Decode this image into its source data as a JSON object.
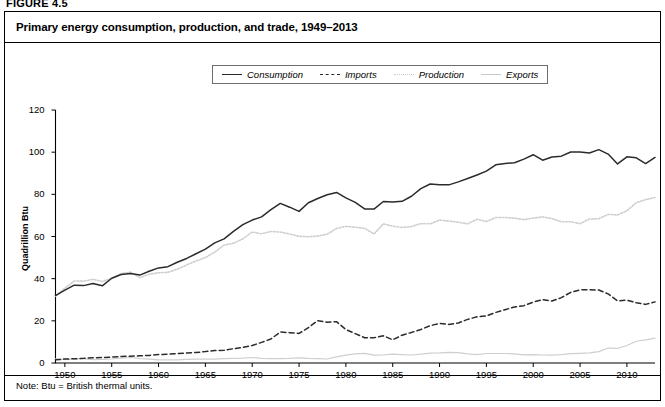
{
  "figure": {
    "number": "FIGURE 4.5",
    "title": "Primary energy consumption, production, and trade, 1949–2013",
    "note": "Note: Btu = British thermal units."
  },
  "legend": {
    "position": "top-center",
    "items": [
      {
        "label": "Consumption",
        "style": "solid",
        "color": "#2b2b2b",
        "icon": "line-solid-icon"
      },
      {
        "label": "Imports",
        "style": "dashed",
        "color": "#2b2b2b",
        "icon": "line-dashed-icon"
      },
      {
        "label": "Production",
        "style": "dotted",
        "color": "#c9c9c9",
        "icon": "line-dotted-icon"
      },
      {
        "label": "Exports",
        "style": "solid-light",
        "color": "#c9c9c9",
        "icon": "line-light-icon"
      }
    ]
  },
  "chart_data": {
    "type": "line",
    "title": "Primary energy consumption, production, and trade, 1949–2013",
    "xlabel": "",
    "ylabel": "Quadrillion Btu",
    "xlim": [
      1949,
      2013
    ],
    "ylim": [
      0,
      120
    ],
    "yticks": [
      0,
      20,
      40,
      60,
      80,
      100,
      120
    ],
    "xticks": [
      1950,
      1955,
      1960,
      1965,
      1970,
      1975,
      1980,
      1985,
      1990,
      1995,
      2000,
      2005,
      2010
    ],
    "grid": false,
    "legend_position": "top-center",
    "x": [
      1949,
      1950,
      1951,
      1952,
      1953,
      1954,
      1955,
      1956,
      1957,
      1958,
      1959,
      1960,
      1961,
      1962,
      1963,
      1964,
      1965,
      1966,
      1967,
      1968,
      1969,
      1970,
      1971,
      1972,
      1973,
      1974,
      1975,
      1976,
      1977,
      1978,
      1979,
      1980,
      1981,
      1982,
      1983,
      1984,
      1985,
      1986,
      1987,
      1988,
      1989,
      1990,
      1991,
      1992,
      1993,
      1994,
      1995,
      1996,
      1997,
      1998,
      1999,
      2000,
      2001,
      2002,
      2003,
      2004,
      2005,
      2006,
      2007,
      2008,
      2009,
      2010,
      2011,
      2012,
      2013
    ],
    "series": [
      {
        "name": "Consumption",
        "style": "solid",
        "color": "#2b2b2b",
        "values": [
          32.0,
          34.6,
          36.9,
          36.7,
          37.7,
          36.6,
          40.2,
          42.0,
          42.4,
          41.7,
          43.5,
          45.1,
          45.7,
          47.8,
          49.6,
          51.8,
          54.0,
          57.0,
          58.9,
          62.4,
          65.6,
          67.8,
          69.3,
          72.7,
          75.7,
          73.9,
          71.9,
          76.0,
          78.0,
          79.8,
          80.9,
          78.3,
          76.2,
          73.1,
          73.0,
          76.6,
          76.4,
          76.7,
          79.1,
          82.7,
          84.9,
          84.5,
          84.5,
          85.9,
          87.5,
          89.2,
          91.0,
          94.0,
          94.6,
          95.0,
          96.7,
          98.8,
          96.2,
          97.7,
          98.1,
          100.1,
          100.1,
          99.6,
          101.2,
          99.1,
          94.4,
          97.8,
          97.3,
          94.6,
          97.5
        ]
      },
      {
        "name": "Production",
        "style": "dotted",
        "color": "#c9c9c9",
        "values": [
          31.7,
          35.5,
          38.9,
          38.8,
          39.7,
          38.7,
          40.1,
          42.4,
          43.1,
          40.5,
          42.1,
          42.8,
          43.0,
          44.5,
          46.5,
          48.4,
          50.0,
          52.6,
          55.9,
          56.8,
          58.9,
          62.1,
          61.3,
          62.4,
          62.1,
          61.2,
          60.1,
          59.9,
          60.2,
          61.1,
          63.8,
          64.8,
          64.4,
          63.9,
          61.2,
          66.0,
          64.9,
          64.3,
          64.7,
          66.1,
          66.0,
          67.8,
          67.3,
          66.8,
          66.0,
          68.2,
          67.1,
          69.0,
          69.0,
          68.7,
          68.0,
          68.7,
          69.3,
          68.5,
          67.0,
          67.0,
          66.1,
          68.3,
          68.4,
          70.5,
          70.2,
          72.2,
          76.0,
          77.5,
          78.5
        ]
      },
      {
        "name": "Imports",
        "style": "dashed",
        "color": "#2b2b2b",
        "values": [
          1.5,
          1.9,
          2.0,
          2.2,
          2.5,
          2.6,
          2.8,
          3.1,
          3.2,
          3.4,
          3.6,
          4.0,
          4.2,
          4.5,
          4.7,
          5.0,
          5.4,
          5.9,
          6.0,
          6.8,
          7.4,
          8.3,
          9.8,
          11.4,
          14.7,
          14.4,
          14.0,
          16.8,
          20.1,
          19.3,
          19.6,
          15.9,
          13.9,
          12.0,
          12.0,
          12.9,
          11.0,
          13.2,
          14.5,
          15.9,
          17.7,
          18.8,
          18.3,
          19.0,
          20.7,
          21.9,
          22.3,
          24.0,
          25.3,
          26.6,
          27.2,
          28.9,
          30.0,
          29.4,
          31.0,
          33.5,
          34.7,
          34.7,
          34.6,
          32.8,
          29.5,
          29.8,
          28.6,
          27.8,
          29.0
        ]
      },
      {
        "name": "Exports",
        "style": "solid-light",
        "color": "#c9c9c9",
        "values": [
          2.0,
          1.6,
          2.0,
          2.0,
          1.6,
          1.7,
          1.9,
          2.3,
          2.6,
          2.1,
          1.8,
          1.5,
          1.5,
          1.5,
          1.7,
          1.8,
          1.8,
          1.8,
          2.1,
          2.2,
          2.3,
          2.6,
          2.2,
          2.1,
          2.1,
          2.2,
          2.4,
          2.2,
          2.1,
          1.9,
          2.9,
          3.7,
          4.3,
          4.6,
          3.7,
          3.8,
          4.2,
          4.0,
          3.8,
          4.2,
          4.7,
          4.8,
          5.0,
          4.9,
          4.3,
          4.0,
          4.5,
          4.5,
          4.5,
          4.3,
          3.9,
          4.0,
          3.8,
          3.7,
          4.0,
          4.4,
          4.6,
          4.8,
          5.4,
          7.1,
          6.9,
          8.3,
          10.3,
          11.0,
          11.8
        ]
      }
    ]
  },
  "axes": {
    "y_title": "Quadrillion Btu",
    "y_labels": [
      "0",
      "20",
      "40",
      "60",
      "80",
      "100",
      "120"
    ],
    "x_labels": [
      "1950",
      "1955",
      "1960",
      "1965",
      "1970",
      "1975",
      "1980",
      "1985",
      "1990",
      "1995",
      "2000",
      "2005",
      "2010"
    ]
  }
}
